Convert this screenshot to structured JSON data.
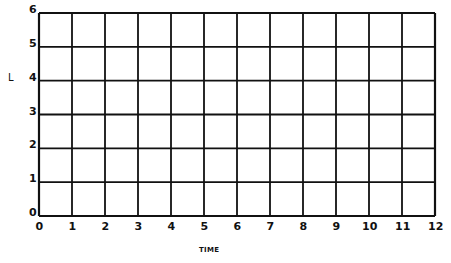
{
  "chart_data": {
    "type": "line",
    "title": "",
    "xlabel": "TIME",
    "ylabel": "L",
    "x_ticks": [
      "0",
      "1",
      "2",
      "3",
      "4",
      "5",
      "6",
      "7",
      "8",
      "9",
      "10",
      "11",
      "12"
    ],
    "y_ticks": [
      "0",
      "1",
      "2",
      "3",
      "4",
      "5",
      "6"
    ],
    "xlim": [
      0,
      12
    ],
    "ylim": [
      0,
      6
    ],
    "grid": true,
    "series": [],
    "legend": null
  },
  "colors": {
    "grid": "#111111",
    "background": "#ffffff"
  }
}
